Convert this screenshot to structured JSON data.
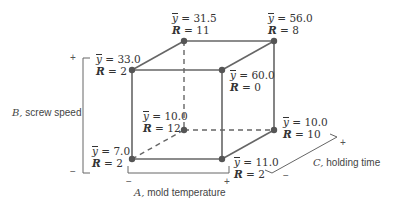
{
  "diagram": {
    "type": "factorial-cube",
    "colors": {
      "line": "#666666",
      "point": "#555555",
      "text": "#333333"
    },
    "vertices": [
      {
        "id": "front-top-left",
        "ybar_label": "y",
        "ybar": "= 33.0",
        "R_label": "R",
        "R": "= 2"
      },
      {
        "id": "back-top-left",
        "ybar_label": "y",
        "ybar": "= 31.5",
        "R_label": "R",
        "R": "= 11"
      },
      {
        "id": "back-top-right",
        "ybar_label": "y",
        "ybar": "= 56.0",
        "R_label": "R",
        "R": "= 8"
      },
      {
        "id": "front-top-right",
        "ybar_label": "y",
        "ybar": "= 60.0",
        "R_label": "R",
        "R": "= 0"
      },
      {
        "id": "back-bottom-left",
        "ybar_label": "y",
        "ybar": "= 10.0",
        "R_label": "R",
        "R": "= 12"
      },
      {
        "id": "back-bottom-right",
        "ybar_label": "y",
        "ybar": "= 10.0",
        "R_label": "R",
        "R": "= 10"
      },
      {
        "id": "front-bottom-left",
        "ybar_label": "y",
        "ybar": "= 7.0",
        "R_label": "R",
        "R": "= 2"
      },
      {
        "id": "front-bottom-right",
        "ybar_label": "y",
        "ybar": "= 11.0",
        "R_label": "R",
        "R": "= 2"
      }
    ],
    "axes": {
      "A": {
        "letter": "A,",
        "name": "mold temperature",
        "low": "−",
        "high": "+"
      },
      "B": {
        "letter": "B,",
        "name": "screw speed",
        "low": "−",
        "high": "+"
      },
      "C": {
        "letter": "C,",
        "name": "holding time",
        "low": "−",
        "high": "+"
      }
    }
  }
}
